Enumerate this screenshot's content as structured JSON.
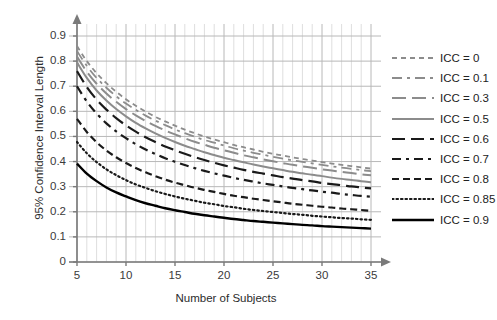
{
  "chart_data": {
    "type": "line",
    "title": "",
    "xlabel": "Number of Subjects",
    "ylabel": "95% Confidence Interval Length",
    "xlim": [
      5,
      35
    ],
    "ylim": [
      0,
      0.9
    ],
    "xticks": [
      "5",
      "10",
      "15",
      "20",
      "25",
      "30",
      "35"
    ],
    "yticks": [
      "0",
      "0.1",
      "0.2",
      "0.3",
      "0.4",
      "0.5",
      "0.6",
      "0.7",
      "0.8",
      "0.9"
    ],
    "x": [
      5,
      6,
      7,
      8,
      9,
      10,
      11,
      12,
      13,
      14,
      15,
      16,
      17,
      18,
      19,
      20,
      21,
      22,
      23,
      24,
      25,
      26,
      27,
      28,
      29,
      30,
      31,
      32,
      33,
      34,
      35
    ],
    "grid": true,
    "minor_grid": true,
    "legend_position": "right",
    "series": [
      {
        "name": "ICC = 0",
        "color": "#8c8c8c",
        "dash": "5,4",
        "width": 1.8,
        "values": [
          0.86,
          0.8,
          0.752,
          0.712,
          0.678,
          0.648,
          0.622,
          0.599,
          0.578,
          0.56,
          0.543,
          0.527,
          0.513,
          0.5,
          0.488,
          0.477,
          0.466,
          0.457,
          0.448,
          0.439,
          0.431,
          0.424,
          0.417,
          0.41,
          0.404,
          0.398,
          0.392,
          0.387,
          0.382,
          0.377,
          0.372
        ]
      },
      {
        "name": "ICC = 0.1",
        "color": "#8c8c8c",
        "dash": "10,5,3,5",
        "width": 1.8,
        "values": [
          0.84,
          0.781,
          0.733,
          0.694,
          0.66,
          0.631,
          0.606,
          0.583,
          0.563,
          0.545,
          0.528,
          0.513,
          0.499,
          0.486,
          0.475,
          0.464,
          0.453,
          0.444,
          0.435,
          0.427,
          0.419,
          0.412,
          0.405,
          0.399,
          0.393,
          0.387,
          0.381,
          0.376,
          0.371,
          0.366,
          0.362
        ]
      },
      {
        "name": "ICC = 0.3",
        "color": "#8c8c8c",
        "dash": "14,6",
        "width": 2.0,
        "values": [
          0.818,
          0.758,
          0.71,
          0.671,
          0.638,
          0.609,
          0.584,
          0.562,
          0.542,
          0.524,
          0.508,
          0.493,
          0.479,
          0.467,
          0.455,
          0.445,
          0.435,
          0.425,
          0.417,
          0.409,
          0.401,
          0.394,
          0.387,
          0.381,
          0.375,
          0.369,
          0.364,
          0.359,
          0.354,
          0.349,
          0.345
        ]
      },
      {
        "name": "ICC = 0.5",
        "color": "#8c8c8c",
        "dash": "none",
        "width": 2.0,
        "values": [
          0.795,
          0.733,
          0.683,
          0.643,
          0.609,
          0.58,
          0.554,
          0.532,
          0.512,
          0.494,
          0.478,
          0.463,
          0.45,
          0.437,
          0.426,
          0.415,
          0.406,
          0.397,
          0.388,
          0.38,
          0.373,
          0.366,
          0.359,
          0.353,
          0.347,
          0.342,
          0.336,
          0.331,
          0.327,
          0.322,
          0.318
        ]
      },
      {
        "name": "ICC = 0.6",
        "color": "#1a1a1a",
        "dash": "13,6",
        "width": 2.2,
        "values": [
          0.76,
          0.697,
          0.647,
          0.607,
          0.573,
          0.544,
          0.519,
          0.497,
          0.478,
          0.46,
          0.445,
          0.431,
          0.418,
          0.406,
          0.395,
          0.385,
          0.376,
          0.367,
          0.359,
          0.352,
          0.345,
          0.338,
          0.332,
          0.326,
          0.321,
          0.315,
          0.31,
          0.306,
          0.301,
          0.297,
          0.293
        ]
      },
      {
        "name": "ICC = 0.7",
        "color": "#1a1a1a",
        "dash": "9,5,3,5",
        "width": 2.2,
        "values": [
          0.7,
          0.639,
          0.591,
          0.552,
          0.52,
          0.493,
          0.469,
          0.448,
          0.43,
          0.413,
          0.399,
          0.386,
          0.374,
          0.363,
          0.353,
          0.344,
          0.335,
          0.327,
          0.32,
          0.313,
          0.307,
          0.301,
          0.295,
          0.29,
          0.285,
          0.28,
          0.276,
          0.271,
          0.267,
          0.263,
          0.26
        ]
      },
      {
        "name": "ICC = 0.8",
        "color": "#1a1a1a",
        "dash": "7,4",
        "width": 2.2,
        "values": [
          0.57,
          0.518,
          0.477,
          0.444,
          0.417,
          0.394,
          0.374,
          0.357,
          0.342,
          0.328,
          0.316,
          0.306,
          0.296,
          0.287,
          0.279,
          0.271,
          0.264,
          0.258,
          0.252,
          0.247,
          0.242,
          0.237,
          0.232,
          0.228,
          0.224,
          0.22,
          0.217,
          0.213,
          0.21,
          0.207,
          0.204
        ]
      },
      {
        "name": "ICC = 0.85",
        "color": "#1a1a1a",
        "dash": "1.5,3",
        "width": 2.2,
        "values": [
          0.478,
          0.433,
          0.398,
          0.369,
          0.346,
          0.326,
          0.309,
          0.295,
          0.282,
          0.271,
          0.261,
          0.252,
          0.244,
          0.236,
          0.23,
          0.223,
          0.218,
          0.212,
          0.207,
          0.203,
          0.199,
          0.195,
          0.191,
          0.188,
          0.184,
          0.181,
          0.178,
          0.175,
          0.173,
          0.17,
          0.168
        ]
      },
      {
        "name": "ICC = 0.9",
        "color": "#000000",
        "dash": "none",
        "width": 2.4,
        "values": [
          0.392,
          0.352,
          0.322,
          0.297,
          0.277,
          0.261,
          0.246,
          0.234,
          0.224,
          0.214,
          0.206,
          0.199,
          0.192,
          0.186,
          0.181,
          0.176,
          0.171,
          0.167,
          0.163,
          0.16,
          0.157,
          0.154,
          0.151,
          0.148,
          0.146,
          0.143,
          0.141,
          0.139,
          0.137,
          0.135,
          0.133
        ]
      }
    ]
  },
  "axes": {
    "grid_major_color": "#b8b8b8",
    "grid_minor_color": "#dedede",
    "axis_color": "#7a7a7a"
  }
}
